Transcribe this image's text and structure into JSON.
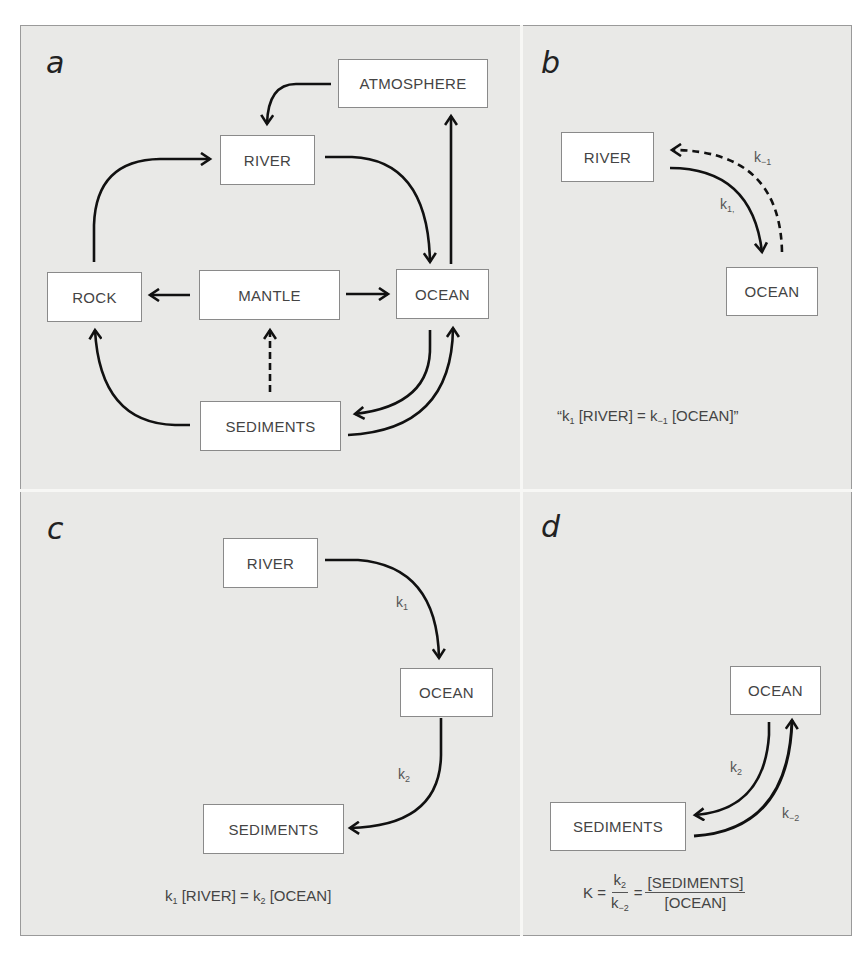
{
  "panels": {
    "a": {
      "letter": "a",
      "boxes": {
        "atmosphere": "ATMOSPHERE",
        "river": "RIVER",
        "rock": "ROCK",
        "mantle": "MANTLE",
        "ocean": "OCEAN",
        "sediments": "SEDIMENTS"
      },
      "flows": [
        {
          "from": "ATMOSPHERE",
          "to": "RIVER",
          "style": "solid"
        },
        {
          "from": "RIVER",
          "to": "OCEAN",
          "style": "solid"
        },
        {
          "from": "OCEAN",
          "to": "ATMOSPHERE",
          "style": "solid"
        },
        {
          "from": "ROCK",
          "to": "RIVER",
          "style": "solid"
        },
        {
          "from": "MANTLE",
          "to": "ROCK",
          "style": "solid"
        },
        {
          "from": "MANTLE",
          "to": "OCEAN",
          "style": "solid"
        },
        {
          "from": "SEDIMENTS",
          "to": "MANTLE",
          "style": "dashed"
        },
        {
          "from": "SEDIMENTS",
          "to": "ROCK",
          "style": "solid"
        },
        {
          "from": "OCEAN",
          "to": "SEDIMENTS",
          "style": "solid"
        },
        {
          "from": "SEDIMENTS",
          "to": "OCEAN",
          "style": "solid"
        }
      ]
    },
    "b": {
      "letter": "b",
      "boxes": {
        "river": "RIVER",
        "ocean": "OCEAN"
      },
      "k_forward": {
        "base": "k",
        "sub": "1,"
      },
      "k_reverse": {
        "base": "k",
        "sub": "−1"
      },
      "equation": {
        "open_quote": "“",
        "k1_base": "k",
        "k1_sub": "1",
        "left_term": "[RIVER] = ",
        "k2_base": "k",
        "k2_sub": "−1",
        "right_term": "[OCEAN]",
        "close_quote": "”"
      }
    },
    "c": {
      "letter": "c",
      "boxes": {
        "river": "RIVER",
        "ocean": "OCEAN",
        "sediments": "SEDIMENTS"
      },
      "k1": {
        "base": "k",
        "sub": "1"
      },
      "k2": {
        "base": "k",
        "sub": "2"
      },
      "equation": {
        "k1_base": "k",
        "k1_sub": "1",
        "left_term": "[RIVER] = ",
        "k2_base": "k",
        "k2_sub": "2",
        "right_term": "[OCEAN]"
      }
    },
    "d": {
      "letter": "d",
      "boxes": {
        "ocean": "OCEAN",
        "sediments": "SEDIMENTS"
      },
      "k_forward": {
        "base": "k",
        "sub": "2"
      },
      "k_reverse": {
        "base": "k",
        "sub": "−2"
      },
      "equation": {
        "lhs": "K =",
        "num_base": "k",
        "num_sub": "2",
        "den_base": "k",
        "den_sub": "−2",
        "equals": "=",
        "rhs_num": "[SEDIMENTS]",
        "rhs_den": "[OCEAN]"
      }
    }
  },
  "colors": {
    "background": "#e9e9e7",
    "box_fill": "#ffffff",
    "arrow": "#111111",
    "text": "#444444"
  }
}
